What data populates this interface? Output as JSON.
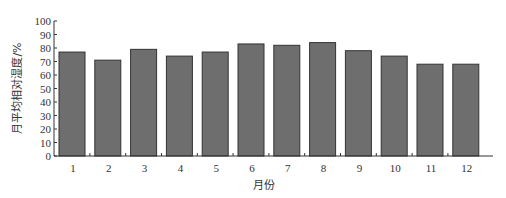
{
  "chart_data": {
    "type": "bar",
    "title": "",
    "xlabel": "月份",
    "ylabel": "月平均相对湿度/%",
    "categories": [
      "1",
      "2",
      "3",
      "4",
      "5",
      "6",
      "7",
      "8",
      "9",
      "10",
      "11",
      "12"
    ],
    "values": [
      77,
      71,
      79,
      74,
      77,
      83,
      82,
      84,
      78,
      74,
      68,
      68
    ],
    "ylim": [
      0,
      100
    ],
    "yticks": [
      0,
      10,
      20,
      30,
      40,
      50,
      60,
      70,
      80,
      90,
      100
    ],
    "grid": false,
    "legend": null,
    "bar_color": "#6e6e6e",
    "bar_edge_color": "#333333"
  }
}
